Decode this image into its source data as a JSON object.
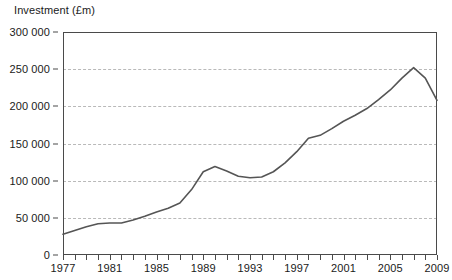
{
  "chart_data": {
    "type": "line",
    "title": "Investment (£m)",
    "xlabel": "",
    "ylabel": "Investment (£m)",
    "ylim": [
      0,
      300000
    ],
    "xlim": [
      1977,
      2009
    ],
    "grid": true,
    "legend": "none",
    "y_ticks": [
      0,
      50000,
      100000,
      150000,
      200000,
      250000,
      300000
    ],
    "y_tick_labels": [
      "0",
      "50 000",
      "100 000",
      "150 000",
      "200 000",
      "250 000",
      "300 000"
    ],
    "x_ticks": [
      1977,
      1978,
      1979,
      1980,
      1981,
      1982,
      1983,
      1984,
      1985,
      1986,
      1987,
      1988,
      1989,
      1990,
      1991,
      1992,
      1993,
      1994,
      1995,
      1996,
      1997,
      1998,
      1999,
      2000,
      2001,
      2002,
      2003,
      2004,
      2005,
      2006,
      2007,
      2008,
      2009
    ],
    "x_tick_labels": [
      "1977",
      "1981",
      "1985",
      "1989",
      "1993",
      "1997",
      "2001",
      "2005",
      "2009"
    ],
    "x_labeled_ticks": [
      1977,
      1981,
      1985,
      1989,
      1993,
      1997,
      2001,
      2005,
      2009
    ],
    "series": [
      {
        "name": "Investment",
        "color": "#555555",
        "x": [
          1977,
          1978,
          1979,
          1980,
          1981,
          1982,
          1983,
          1984,
          1985,
          1986,
          1987,
          1988,
          1989,
          1990,
          1991,
          1992,
          1993,
          1994,
          1995,
          1996,
          1997,
          1998,
          1999,
          2000,
          2001,
          2002,
          2003,
          2004,
          2005,
          2006,
          2007,
          2008,
          2009
        ],
        "values": [
          28000,
          33000,
          38000,
          42000,
          43000,
          43000,
          47000,
          52000,
          58000,
          63000,
          70000,
          88000,
          112000,
          119000,
          113000,
          106000,
          104000,
          105000,
          112000,
          124000,
          139000,
          157000,
          161000,
          170000,
          180000,
          188000,
          197000,
          209000,
          222000,
          238000,
          252000,
          238000,
          208000
        ]
      }
    ]
  }
}
